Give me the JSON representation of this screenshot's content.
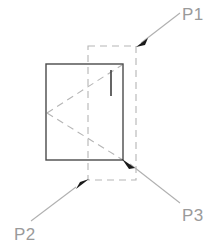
{
  "figure": {
    "type": "technical-line-drawing",
    "width": 216,
    "height": 250,
    "background_color": "#ffffff",
    "colors": {
      "solid_outline": "#4a4a4a",
      "dashed_construction": "#b5b5b5",
      "leader_line": "#b0b0b0",
      "arrowhead": "#1a1a1a",
      "label_text": "#9a9a9a"
    },
    "shapes": {
      "solid_rectangle": {
        "name": "main-body-rectangle",
        "x": 46,
        "y": 64,
        "width": 77,
        "height": 96,
        "style": "solid"
      },
      "dashed_rectangle": {
        "name": "hidden-outline-rectangle",
        "x": 88,
        "y": 46,
        "width": 48,
        "height": 134,
        "style": "dashed"
      },
      "interior_tick": {
        "name": "interior-vertical-tick",
        "x1": 111,
        "y1": 70,
        "x2": 111,
        "y2": 96,
        "style": "solid"
      },
      "diagonal_upper": {
        "name": "diagonal-upper-dashed",
        "x1": 47,
        "y1": 113,
        "x2": 122,
        "y2": 65,
        "style": "dashed"
      },
      "diagonal_lower": {
        "name": "diagonal-lower-dashed",
        "x1": 47,
        "y1": 113,
        "x2": 123,
        "y2": 160,
        "style": "dashed"
      }
    },
    "callouts": [
      {
        "id": "P1",
        "label": "P1",
        "label_x": 182,
        "label_y": 20,
        "leader": {
          "x1": 180,
          "y1": 13,
          "x2": 140,
          "y2": 44
        },
        "arrow_tip": {
          "x": 136,
          "y": 47
        },
        "points_to": "dashed-rectangle-top-right-corner"
      },
      {
        "id": "P2",
        "label": "P2",
        "label_x": 14,
        "label_y": 240,
        "leader": {
          "x1": 31,
          "y1": 221,
          "x2": 75,
          "y2": 188
        },
        "arrow_tip": {
          "x": 89,
          "y": 179
        },
        "points_to": "dashed-rectangle-bottom-left-region"
      },
      {
        "id": "P3",
        "label": "P3",
        "label_x": 182,
        "label_y": 221,
        "leader": {
          "x1": 180,
          "y1": 203,
          "x2": 130,
          "y2": 165
        },
        "arrow_tip": {
          "x": 122,
          "y": 159
        },
        "points_to": "solid-rectangle-bottom-right-corner"
      }
    ]
  }
}
